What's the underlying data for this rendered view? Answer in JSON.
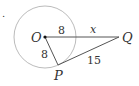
{
  "diagram": {
    "marker": ".",
    "points": {
      "O": "O",
      "P": "P",
      "Q": "Q"
    },
    "labels": {
      "OQ_inner": "8",
      "OP": "8",
      "outer": "x",
      "PQ": "15"
    },
    "colors": {
      "circle": "#aaaaaa",
      "line": "#555555",
      "text": "#333333"
    }
  }
}
